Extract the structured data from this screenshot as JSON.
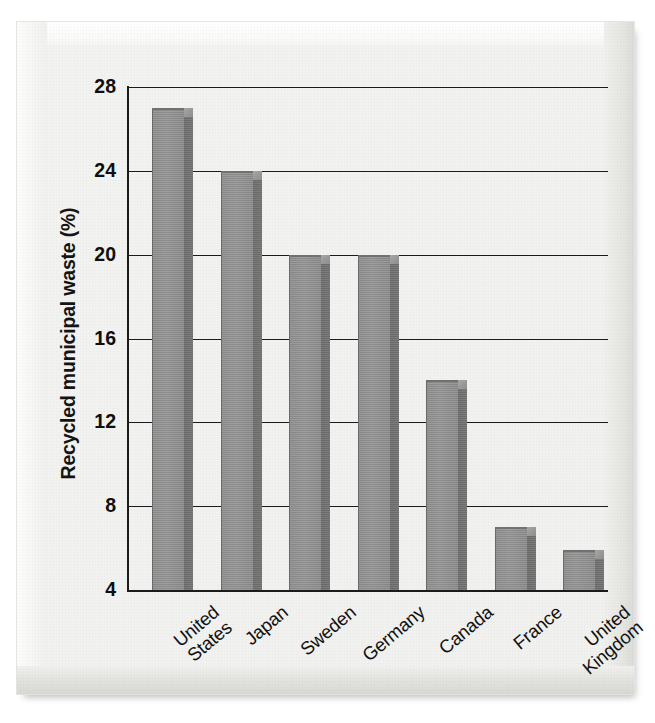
{
  "figure": {
    "type": "bar-chart-scan",
    "background_color": "#f1f1ef",
    "bar_face_color": "#909090",
    "bar_side_color": "#717171",
    "axis_color": "#1b1b1b"
  },
  "chart_data": {
    "type": "bar",
    "title": "",
    "xlabel": "",
    "ylabel": "Recycled municipal waste (%)",
    "categories": [
      "United\nStates",
      "Japan",
      "Sweden",
      "Germany",
      "Canada",
      "France",
      "United\nKingdom"
    ],
    "values": [
      27,
      24,
      20,
      20,
      14,
      7,
      5.9
    ],
    "ylim": [
      4,
      28
    ],
    "yticks": [
      4,
      8,
      12,
      16,
      20,
      24,
      28
    ],
    "ytick_labels": [
      "4",
      "8",
      "12",
      "16",
      "20",
      "24",
      "28"
    ],
    "grid": "horizontal",
    "legend": "none",
    "bar_style": "3d-extruded-gray"
  },
  "axis": {
    "y_title": "Recycled municipal waste (%)"
  }
}
